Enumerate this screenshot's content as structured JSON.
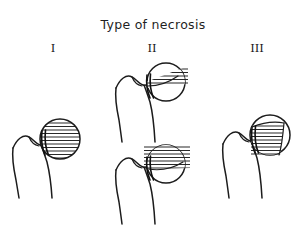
{
  "figure": {
    "title": "Type of necrosis",
    "background_color": "#ffffff",
    "line_color": "#1c1c1c",
    "columns": [
      {
        "id": "I",
        "label": "I"
      },
      {
        "id": "II",
        "label": "II"
      },
      {
        "id": "III",
        "label": "III"
      }
    ],
    "panels": [
      {
        "id": "type-1",
        "type_label": "I",
        "position": "left",
        "description": "Proximal femur with femoral head fully hatched",
        "necrosis_region": "entire-head",
        "hatch_orientation": "horizontal",
        "hatch_line_count": 11,
        "fracture_line": "subcapital"
      },
      {
        "id": "type-2a",
        "type_label": "II",
        "position": "center-upper",
        "description": "Proximal femur with necrosis limited to superior wedge of head",
        "necrosis_region": "superior-wedge",
        "hatch_orientation": "horizontal",
        "hatch_line_count": 5,
        "fracture_line": "subcapital"
      },
      {
        "id": "type-2b",
        "type_label": "II",
        "position": "center-lower",
        "description": "Proximal femur with necrosis covering superior half of head",
        "necrosis_region": "superior-half",
        "hatch_orientation": "horizontal",
        "hatch_line_count": 8,
        "fracture_line": "subcapital"
      },
      {
        "id": "type-3",
        "type_label": "III",
        "position": "right",
        "description": "Proximal femur with necrosis as a band across the medial/inferior head",
        "necrosis_region": "medial-band",
        "hatch_orientation": "horizontal",
        "hatch_line_count": 9,
        "fracture_line": "subcapital"
      }
    ]
  }
}
